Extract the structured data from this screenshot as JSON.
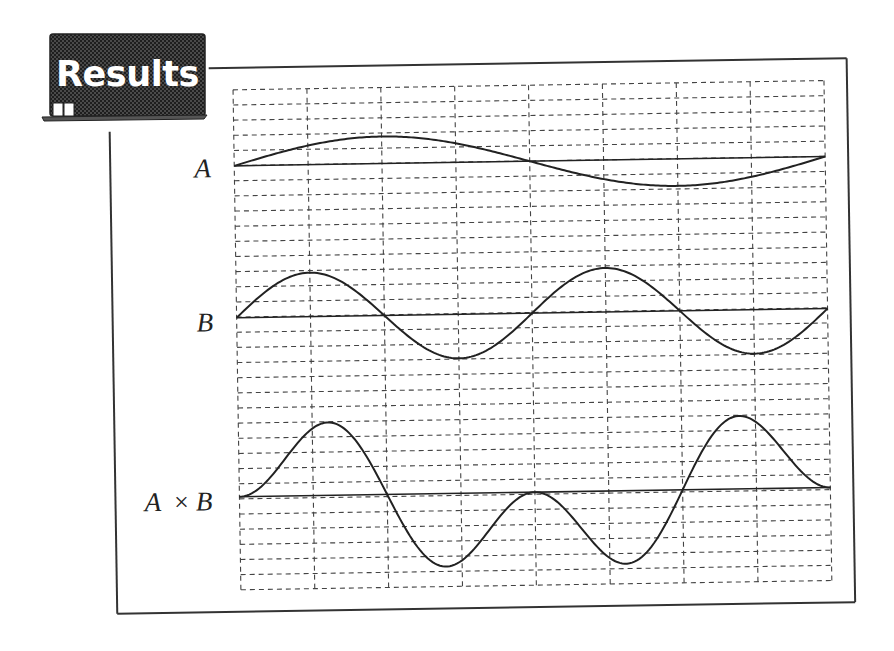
{
  "badge": {
    "title": "Results",
    "bg_color": "#3a3a3a",
    "text_color": "#ffffff"
  },
  "colors": {
    "frame": "#333333",
    "grid": "#444444",
    "curve": "#222222"
  },
  "chart_data": {
    "type": "line",
    "title": "Results",
    "grid": {
      "on": true,
      "style": "dashed",
      "columns": 8,
      "rows": 33
    },
    "x": {
      "range": [
        0,
        1
      ],
      "unit": "one period of A"
    },
    "series": [
      {
        "name": "A",
        "label": "A",
        "function": "sin(2πx)",
        "periods": 1,
        "amplitude": 1.0,
        "baseline": "horizontal axis"
      },
      {
        "name": "B",
        "label": "B",
        "function": "sin(4πx)",
        "periods": 2,
        "amplitude": 1.0,
        "baseline": "horizontal axis"
      },
      {
        "name": "A×B",
        "label": "A ×B",
        "function": "sin(2πx)·sin(4πx)",
        "amplitude": 1.0,
        "baseline": "horizontal axis"
      }
    ],
    "labels": [
      "A",
      "B",
      "A ×B"
    ],
    "legend": "none"
  },
  "labels": {
    "a": "A",
    "b": "B",
    "ab_left": "A",
    "ab_op": "×",
    "ab_right": "B"
  }
}
